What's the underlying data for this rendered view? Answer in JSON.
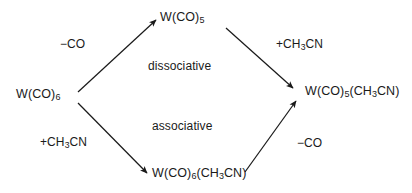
{
  "diagram": {
    "background_color": "#ffffff",
    "line_color": "#1a1a1a",
    "nodes": {
      "reactant": {
        "formula": "W(CO)6",
        "html": "W(CO)<sub>6</sub>"
      },
      "top": {
        "formula": "W(CO)5",
        "html": "W(CO)<sub>5</sub>"
      },
      "bottom": {
        "formula": "W(CO)6(CH3CN)",
        "html": "W(CO)<sub>6</sub>(CH<sub>3</sub>CN)"
      },
      "product": {
        "formula": "W(CO)5(CH3CN)",
        "html": "W(CO)<sub>5</sub>(CH<sub>3</sub>CN)"
      }
    },
    "reagents": {
      "top_left": {
        "text": "-CO",
        "html": "&minus;CO"
      },
      "top_right": {
        "text": "+CH3CN",
        "html": "+CH<sub>3</sub>CN"
      },
      "bottom_left": {
        "text": "+CH3CN",
        "html": "+CH<sub>3</sub>CN"
      },
      "bottom_right": {
        "text": "-CO",
        "html": "&minus;CO"
      }
    },
    "pathways": {
      "upper": "dissociative",
      "lower": "associative"
    },
    "arrows": [
      {
        "name": "reactant-to-top",
        "from": "reactant",
        "to": "top",
        "label": "-CO"
      },
      {
        "name": "top-to-product",
        "from": "top",
        "to": "product",
        "label": "+CH3CN"
      },
      {
        "name": "reactant-to-bottom",
        "from": "reactant",
        "to": "bottom",
        "label": "+CH3CN"
      },
      {
        "name": "bottom-to-product",
        "from": "bottom",
        "to": "product",
        "label": "-CO"
      }
    ]
  }
}
